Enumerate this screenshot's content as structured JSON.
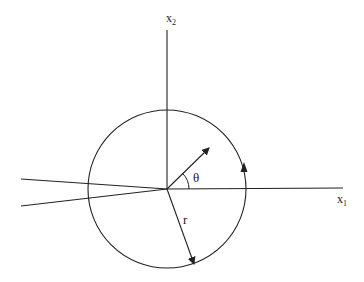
{
  "diagram": {
    "type": "polar-coordinate-contour",
    "labels": {
      "x1_main": "x",
      "x1_sub": "1",
      "x2_main": "x",
      "x2_sub": "2",
      "theta": "θ",
      "r": "r"
    },
    "geometry": {
      "origin": [
        167,
        189
      ],
      "circle_radius": 79,
      "horizontal_axis": {
        "from": [
          167,
          189
        ],
        "to": [
          343,
          188
        ]
      },
      "vertical_axis": {
        "from": [
          167,
          30
        ],
        "to": [
          167,
          189
        ]
      },
      "branch_cut_upper": {
        "from": [
          21,
          179
        ],
        "to": [
          167,
          189
        ]
      },
      "branch_cut_lower": {
        "from": [
          21,
          206
        ],
        "to": [
          167,
          189
        ]
      },
      "radius_vector_theta": {
        "from": [
          167,
          189
        ],
        "to": [
          210,
          147
        ]
      },
      "radius_vector_r": {
        "from": [
          167,
          189
        ],
        "to": [
          195,
          265
        ]
      },
      "angle_arc_radius": 22,
      "contour_direction": "counterclockwise"
    },
    "colors": {
      "stroke": "#222222",
      "background": "#ffffff"
    }
  }
}
